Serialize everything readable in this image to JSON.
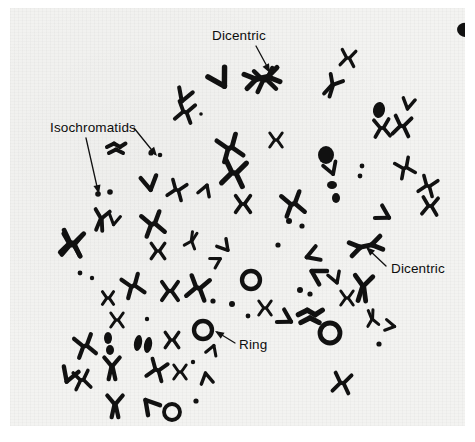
{
  "figure": {
    "kind": "light-micrograph",
    "background_color": "#f3f3f1",
    "page_color": "#ffffff",
    "stain_color": "#111111",
    "width": 475,
    "height": 442
  },
  "annotations": [
    {
      "id": "dicentric-top",
      "label": "Dicentric",
      "text_x": 202,
      "text_y": 32,
      "leader": "M 246 38 L 259 62",
      "arrow_x": 260,
      "arrow_y": 65,
      "arrow_angle": 62
    },
    {
      "id": "isochromatids",
      "label": "Isochromatids",
      "text_x": 40,
      "text_y": 124,
      "leader_a": "M 76 130 L 88 183",
      "arrow_a_x": 89,
      "arrow_a_y": 186,
      "arrow_a_angle": 77,
      "leader_b": "M 124 120 L 145 146",
      "arrow_b_x": 147,
      "arrow_b_y": 148,
      "arrow_b_angle": 51
    },
    {
      "id": "dicentric-right",
      "label": "Dicentric",
      "text_x": 381,
      "text_y": 265,
      "leader": "M 376 258 L 358 241",
      "arrow_x": 356,
      "arrow_y": 239,
      "arrow_angle": 223
    },
    {
      "id": "ring",
      "label": "Ring",
      "text_x": 229,
      "text_y": 341,
      "leader": "M 225 335 L 207 324",
      "arrow_x": 205,
      "arrow_y": 323,
      "arrow_angle": 212
    }
  ],
  "chromosomes": {
    "count_drawn": 96,
    "note": "dark stained chromosome bodies of the metaphase spread",
    "shapes": [
      {
        "type": "blob",
        "cx": 455,
        "cy": 22,
        "rx": 8,
        "ry": 7,
        "rot": 20
      },
      {
        "type": "x",
        "cx": 255,
        "cy": 72,
        "s": 15,
        "rot": -10
      },
      {
        "type": "dicentric",
        "cx": 252,
        "cy": 70,
        "s": 16,
        "rot": -12
      },
      {
        "type": "v",
        "cx": 212,
        "cy": 74,
        "s": 16,
        "rot": 150
      },
      {
        "type": "x",
        "cx": 338,
        "cy": 50,
        "s": 11,
        "rot": 8
      },
      {
        "type": "y",
        "cx": 322,
        "cy": 78,
        "s": 13,
        "rot": 30
      },
      {
        "type": "x",
        "cx": 175,
        "cy": 104,
        "s": 13,
        "rot": 15
      },
      {
        "type": "v",
        "cx": 173,
        "cy": 90,
        "s": 12,
        "rot": 200
      },
      {
        "type": "dot",
        "cx": 191,
        "cy": 106,
        "r": 1.8
      },
      {
        "type": "blob",
        "cx": 369,
        "cy": 102,
        "rx": 6,
        "ry": 8,
        "rot": 10
      },
      {
        "type": "x",
        "cx": 372,
        "cy": 120,
        "s": 12,
        "rot": -5
      },
      {
        "type": "x",
        "cx": 392,
        "cy": 118,
        "s": 13,
        "rot": 10
      },
      {
        "type": "v",
        "cx": 398,
        "cy": 98,
        "s": 10,
        "rot": 190
      },
      {
        "type": "cluster",
        "cx": 106,
        "cy": 140,
        "s": 10
      },
      {
        "type": "dot",
        "cx": 141,
        "cy": 145,
        "r": 2.6
      },
      {
        "type": "dot",
        "cx": 150,
        "cy": 147,
        "r": 2.3
      },
      {
        "type": "x",
        "cx": 220,
        "cy": 140,
        "s": 16,
        "rot": -20
      },
      {
        "type": "x",
        "cx": 224,
        "cy": 165,
        "s": 17,
        "rot": 10
      },
      {
        "type": "x",
        "cx": 266,
        "cy": 132,
        "s": 10,
        "rot": 0
      },
      {
        "type": "blob",
        "cx": 316,
        "cy": 147,
        "rx": 8,
        "ry": 9,
        "rot": 0
      },
      {
        "type": "v",
        "cx": 322,
        "cy": 163,
        "s": 11,
        "rot": 160
      },
      {
        "type": "x",
        "cx": 395,
        "cy": 160,
        "s": 12,
        "rot": -25
      },
      {
        "type": "dot",
        "cx": 352,
        "cy": 158,
        "r": 2.4
      },
      {
        "type": "dot",
        "cx": 350,
        "cy": 168,
        "r": 2.4
      },
      {
        "type": "x",
        "cx": 418,
        "cy": 178,
        "s": 12,
        "rot": 20
      },
      {
        "type": "dot",
        "cx": 88,
        "cy": 186,
        "r": 2.8
      },
      {
        "type": "dot",
        "cx": 100,
        "cy": 184,
        "r": 2.8
      },
      {
        "type": "x",
        "cx": 167,
        "cy": 182,
        "s": 12,
        "rot": 20
      },
      {
        "type": "v",
        "cx": 140,
        "cy": 178,
        "s": 13,
        "rot": 170
      },
      {
        "type": "v",
        "cx": 196,
        "cy": 180,
        "s": 10,
        "rot": 20
      },
      {
        "type": "x",
        "cx": 233,
        "cy": 196,
        "s": 12,
        "rot": 0
      },
      {
        "type": "x",
        "cx": 283,
        "cy": 196,
        "s": 15,
        "rot": -15
      },
      {
        "type": "dot",
        "cx": 279,
        "cy": 213,
        "r": 3
      },
      {
        "type": "dot",
        "cx": 292,
        "cy": 218,
        "r": 2.6
      },
      {
        "type": "blob",
        "cx": 322,
        "cy": 177,
        "rx": 5,
        "ry": 4,
        "rot": 0
      },
      {
        "type": "blob",
        "cx": 326,
        "cy": 190,
        "rx": 4,
        "ry": 5,
        "rot": 0
      },
      {
        "type": "v",
        "cx": 376,
        "cy": 208,
        "s": 12,
        "rot": 120
      },
      {
        "type": "y",
        "cx": 91,
        "cy": 212,
        "s": 13,
        "rot": 10
      },
      {
        "type": "v",
        "cx": 104,
        "cy": 214,
        "s": 9,
        "rot": 190
      },
      {
        "type": "x",
        "cx": 62,
        "cy": 235,
        "s": 16,
        "rot": 10
      },
      {
        "type": "x",
        "cx": 143,
        "cy": 216,
        "s": 15,
        "rot": -15
      },
      {
        "type": "x",
        "cx": 148,
        "cy": 243,
        "s": 11,
        "rot": 0
      },
      {
        "type": "y",
        "cx": 182,
        "cy": 232,
        "s": 10,
        "rot": 200
      },
      {
        "type": "v",
        "cx": 216,
        "cy": 240,
        "s": 10,
        "rot": 140
      },
      {
        "type": "dicentric",
        "cx": 356,
        "cy": 238,
        "s": 15,
        "rot": -12
      },
      {
        "type": "dot",
        "cx": 268,
        "cy": 237,
        "r": 2.6
      },
      {
        "type": "x",
        "cx": 62,
        "cy": 237,
        "s": 15,
        "rot": 5
      },
      {
        "type": "dot",
        "cx": 70,
        "cy": 265,
        "r": 2.4
      },
      {
        "type": "dot",
        "cx": 82,
        "cy": 270,
        "r": 2.2
      },
      {
        "type": "v",
        "cx": 300,
        "cy": 248,
        "s": 12,
        "rot": 250
      },
      {
        "type": "v",
        "cx": 305,
        "cy": 265,
        "s": 13,
        "rot": 300
      },
      {
        "type": "x",
        "cx": 123,
        "cy": 278,
        "s": 14,
        "rot": -20
      },
      {
        "type": "x",
        "cx": 160,
        "cy": 283,
        "s": 13,
        "rot": 0
      },
      {
        "type": "x",
        "cx": 188,
        "cy": 280,
        "s": 15,
        "rot": 15
      },
      {
        "type": "ring",
        "cx": 241,
        "cy": 272,
        "r": 9
      },
      {
        "type": "dot",
        "cx": 203,
        "cy": 293,
        "r": 2.6
      },
      {
        "type": "dot",
        "cx": 222,
        "cy": 296,
        "r": 3
      },
      {
        "type": "dot",
        "cx": 290,
        "cy": 282,
        "r": 3
      },
      {
        "type": "dot",
        "cx": 300,
        "cy": 286,
        "r": 2.6
      },
      {
        "type": "y",
        "cx": 353,
        "cy": 280,
        "s": 16,
        "rot": 5
      },
      {
        "type": "x",
        "cx": 337,
        "cy": 290,
        "s": 10,
        "rot": 0
      },
      {
        "type": "v",
        "cx": 326,
        "cy": 272,
        "s": 10,
        "rot": 160
      },
      {
        "type": "cluster",
        "cx": 300,
        "cy": 308,
        "s": 13
      },
      {
        "type": "v",
        "cx": 278,
        "cy": 312,
        "s": 12,
        "rot": 120
      },
      {
        "type": "ring",
        "cx": 320,
        "cy": 325,
        "r": 10
      },
      {
        "type": "x",
        "cx": 98,
        "cy": 290,
        "s": 9,
        "rot": 0
      },
      {
        "type": "x",
        "cx": 107,
        "cy": 312,
        "s": 10,
        "rot": 0
      },
      {
        "type": "dot",
        "cx": 137,
        "cy": 311,
        "r": 2.2
      },
      {
        "type": "blob",
        "cx": 98,
        "cy": 330,
        "rx": 4,
        "ry": 6,
        "rot": 0
      },
      {
        "type": "blob",
        "cx": 100,
        "cy": 342,
        "rx": 4,
        "ry": 5,
        "rot": 0
      },
      {
        "type": "x",
        "cx": 162,
        "cy": 332,
        "s": 11,
        "rot": 0
      },
      {
        "type": "ring",
        "cx": 193,
        "cy": 322,
        "r": 9
      },
      {
        "type": "v",
        "cx": 203,
        "cy": 340,
        "s": 9,
        "rot": 20
      },
      {
        "type": "x",
        "cx": 75,
        "cy": 338,
        "s": 14,
        "rot": -15
      },
      {
        "type": "blob",
        "cx": 128,
        "cy": 335,
        "rx": 4,
        "ry": 8,
        "rot": 10
      },
      {
        "type": "blob",
        "cx": 138,
        "cy": 337,
        "rx": 4,
        "ry": 8,
        "rot": 10
      },
      {
        "type": "dot",
        "cx": 183,
        "cy": 354,
        "r": 2.2
      },
      {
        "type": "y",
        "cx": 102,
        "cy": 360,
        "s": 14,
        "rot": 0
      },
      {
        "type": "x",
        "cx": 147,
        "cy": 362,
        "s": 13,
        "rot": 20
      },
      {
        "type": "x",
        "cx": 170,
        "cy": 364,
        "s": 10,
        "rot": 0
      },
      {
        "type": "v",
        "cx": 196,
        "cy": 368,
        "s": 10,
        "rot": 350
      },
      {
        "type": "x",
        "cx": 72,
        "cy": 372,
        "s": 12,
        "rot": -10
      },
      {
        "type": "v",
        "cx": 58,
        "cy": 370,
        "s": 13,
        "rot": 200
      },
      {
        "type": "y",
        "cx": 105,
        "cy": 398,
        "s": 14,
        "rot": 0
      },
      {
        "type": "v",
        "cx": 138,
        "cy": 395,
        "s": 13,
        "rot": 320
      },
      {
        "type": "ring",
        "cx": 162,
        "cy": 404,
        "r": 8
      },
      {
        "type": "dot",
        "cx": 186,
        "cy": 393,
        "r": 2.6
      },
      {
        "type": "dot",
        "cx": 150,
        "cy": 428,
        "r": 2.2
      },
      {
        "type": "x",
        "cx": 332,
        "cy": 375,
        "s": 13,
        "rot": 10
      },
      {
        "type": "x",
        "cx": 420,
        "cy": 198,
        "s": 12,
        "rot": 5
      },
      {
        "type": "y",
        "cx": 362,
        "cy": 310,
        "s": 10,
        "rot": 170
      },
      {
        "type": "dot",
        "cx": 369,
        "cy": 336,
        "r": 2.6
      },
      {
        "type": "v",
        "cx": 382,
        "cy": 318,
        "s": 9,
        "rot": 100
      },
      {
        "type": "x",
        "cx": 255,
        "cy": 300,
        "s": 10,
        "rot": 0
      },
      {
        "type": "dot",
        "cx": 238,
        "cy": 308,
        "r": 2.4
      },
      {
        "type": "v",
        "cx": 208,
        "cy": 252,
        "s": 9,
        "rot": 60
      }
    ]
  }
}
